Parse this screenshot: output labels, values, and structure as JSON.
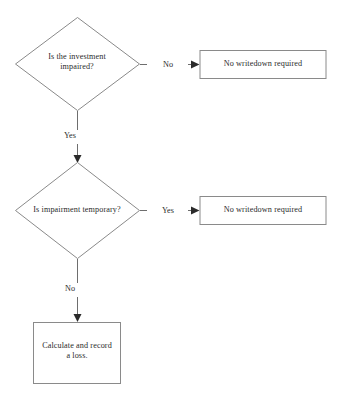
{
  "diagram": {
    "background_color": "#ffffff",
    "line_color": "#6e6e6e",
    "shape_stroke_color": "#8a8a8a",
    "text_color": "#2b2b2b",
    "arrow_color": "#2a2a2a"
  },
  "nodes": {
    "decision_1": {
      "shape": "diamond",
      "text": "Is the investment\nimpaired?",
      "line_1": "Is the investment",
      "line_2": "impaired?"
    },
    "decision_2": {
      "shape": "diamond",
      "text": "Is impairment temporary?",
      "line_1": "Is impairment temporary?"
    },
    "outcome_1": {
      "shape": "rectangle",
      "text": "No writedown required"
    },
    "outcome_2": {
      "shape": "rectangle",
      "text": "No writedown required"
    },
    "outcome_3": {
      "shape": "rectangle",
      "text": "Calculate and record\na loss.",
      "line_1": "Calculate and record",
      "line_2": "a loss."
    }
  },
  "edges": {
    "decision_1_no": {
      "label": "No",
      "from": "decision_1",
      "to": "outcome_1",
      "direction": "right"
    },
    "decision_1_yes": {
      "label": "Yes",
      "from": "decision_1",
      "to": "decision_2",
      "direction": "down"
    },
    "decision_2_yes": {
      "label": "Yes",
      "from": "decision_2",
      "to": "outcome_2",
      "direction": "right"
    },
    "decision_2_no": {
      "label": "No",
      "from": "decision_2",
      "to": "outcome_3",
      "direction": "down"
    }
  }
}
